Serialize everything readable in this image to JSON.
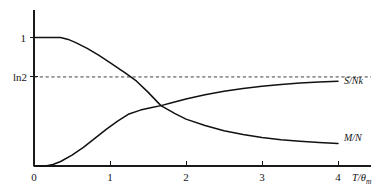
{
  "figure": {
    "background_color": "#ffffff",
    "line_color": "#111111",
    "width": 390,
    "height": 194
  },
  "axes": {
    "x_title": "T/",
    "x_title_symbol": "θ",
    "x_title_subscript": "m",
    "x_ticks": [
      "0",
      "1",
      "2",
      "3",
      "4"
    ],
    "y_tick_one": "1",
    "y_tick_ln2": "ln2"
  },
  "curve_labels": {
    "entropy": "S/Nk",
    "magnetization": "M/N"
  },
  "chart_data": {
    "type": "line",
    "title": "",
    "xlabel": "T/θm",
    "ylabel": "",
    "xlim": [
      0,
      4.35
    ],
    "ylim": [
      0,
      1.12
    ],
    "grid": false,
    "legend": "inline-right-of-curve-ends",
    "x_tick_values": [
      0,
      1,
      2,
      3,
      4
    ],
    "x_tick_labels": [
      "0",
      "1",
      "2",
      "3",
      "4"
    ],
    "y_tick_values": [
      0.693,
      1.0
    ],
    "y_tick_labels": [
      "ln2",
      "1"
    ],
    "reference_lines": [
      {
        "name": "ln2-asymptote",
        "orientation": "horizontal",
        "y": 0.693,
        "label": "ln2",
        "style": "dashed"
      }
    ],
    "crossing_point": {
      "x": 1.67,
      "y": 0.47
    },
    "series": [
      {
        "name": "M/N",
        "label": "M/N",
        "style": "solid",
        "description": "Order parameter: flat at 1 until T/θm≈0.35, then falls monotonically, crossing ln2 near T/θm≈1.2 and decaying toward a small value at T/θm=4",
        "x": [
          0.0,
          0.2,
          0.35,
          0.45,
          0.55,
          0.7,
          0.85,
          1.0,
          1.15,
          1.2,
          1.35,
          1.5,
          1.67,
          1.85,
          2.0,
          2.25,
          2.5,
          2.75,
          3.0,
          3.25,
          3.5,
          3.75,
          4.0
        ],
        "y": [
          1.0,
          1.0,
          1.0,
          0.985,
          0.96,
          0.915,
          0.862,
          0.805,
          0.745,
          0.724,
          0.66,
          0.575,
          0.47,
          0.41,
          0.365,
          0.315,
          0.275,
          0.245,
          0.222,
          0.205,
          0.192,
          0.182,
          0.175
        ]
      },
      {
        "name": "S/Nk",
        "label": "S/Nk",
        "style": "solid",
        "description": "Entropy per particle: zero up to T/θm≈0.2, rises sigmoidally and saturates asymptotically at ln2",
        "x": [
          0.0,
          0.15,
          0.25,
          0.35,
          0.5,
          0.65,
          0.8,
          0.95,
          1.1,
          1.25,
          1.4,
          1.55,
          1.67,
          1.8,
          2.0,
          2.25,
          2.5,
          2.75,
          3.0,
          3.25,
          3.5,
          3.75,
          4.0
        ],
        "y": [
          0.0,
          0.0,
          0.012,
          0.035,
          0.085,
          0.145,
          0.215,
          0.285,
          0.35,
          0.405,
          0.435,
          0.455,
          0.47,
          0.49,
          0.522,
          0.555,
          0.582,
          0.604,
          0.62,
          0.634,
          0.645,
          0.653,
          0.66
        ]
      }
    ]
  }
}
